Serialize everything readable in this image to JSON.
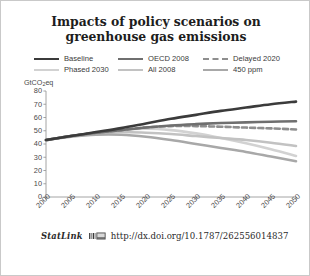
{
  "figure": {
    "border_color": "#c9c9c9",
    "background": "#ffffff"
  },
  "title": "Impacts of policy scenarios on greenhouse gas emissions",
  "footer": {
    "statlink_label": "StatLink",
    "statlink_icon": "statlink-barcode-icon",
    "url": "http://dx.doi.org/10.1787/262556014837"
  },
  "chart_data": {
    "type": "line",
    "title": "Impacts of policy scenarios on greenhouse gas emissions",
    "xlabel": "",
    "ylabel": "GtCO2eq",
    "ylabel_display": "GtCO",
    "ylabel_sub": "2",
    "ylabel_tail": "eq",
    "xlim": [
      2000,
      2050
    ],
    "ylim": [
      0,
      80
    ],
    "yticks": [
      0,
      10,
      20,
      30,
      40,
      50,
      60,
      70,
      80
    ],
    "ytick_labels": [
      "0",
      "10",
      "20",
      "30",
      "40",
      "50",
      "60",
      "70",
      "80"
    ],
    "xticks": [
      2000,
      2005,
      2010,
      2015,
      2020,
      2025,
      2030,
      2035,
      2040,
      2045,
      2050
    ],
    "xtick_labels": [
      "2000",
      "2005",
      "2010",
      "2015",
      "2020",
      "2025",
      "2030",
      "2035",
      "2040",
      "2045",
      "2050"
    ],
    "grid": false,
    "legend_position": "top",
    "x": [
      2000,
      2005,
      2010,
      2015,
      2020,
      2025,
      2030,
      2035,
      2040,
      2045,
      2050
    ],
    "series": [
      {
        "name": "Baseline",
        "color": "#3b3b3b",
        "dash": false,
        "width": 2.6,
        "values": [
          43,
          46,
          49,
          52,
          55.5,
          59,
          62,
          65,
          67.5,
          70,
          72
        ]
      },
      {
        "name": "OECD 2008",
        "color": "#6f6f6f",
        "dash": false,
        "width": 2.6,
        "values": [
          43,
          46,
          48.5,
          50.5,
          52.5,
          54,
          55,
          55.8,
          56.3,
          56.8,
          57.2
        ]
      },
      {
        "name": "Delayed 2020",
        "color": "#8e8e8e",
        "dash": true,
        "width": 2.6,
        "values": [
          43,
          46,
          48.5,
          50.5,
          52.5,
          53.5,
          53.5,
          53,
          52.4,
          51.8,
          51
        ]
      },
      {
        "name": "Phased 2030",
        "color": "#d2d2d2",
        "dash": false,
        "width": 2.6,
        "values": [
          43,
          46,
          48.5,
          50.5,
          51.5,
          50.5,
          48,
          44.5,
          40.5,
          36,
          31
        ]
      },
      {
        "name": "All 2008",
        "color": "#c2c2c2",
        "dash": false,
        "width": 2.6,
        "values": [
          43,
          46,
          48,
          49,
          48.5,
          47.5,
          46,
          44.5,
          43,
          41,
          38.5
        ]
      },
      {
        "name": "450 ppm",
        "color": "#a8a8a8",
        "dash": false,
        "width": 2.6,
        "values": [
          43,
          45.5,
          47,
          47,
          45.5,
          43,
          40,
          37,
          34,
          30.5,
          27
        ]
      }
    ],
    "legend_order": [
      "Baseline",
      "OECD 2008",
      "Delayed 2020",
      "Phased 2030",
      "All 2008",
      "450 ppm"
    ]
  }
}
